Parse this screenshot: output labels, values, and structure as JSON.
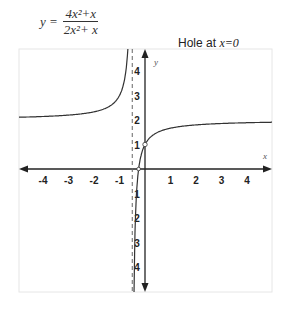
{
  "header": {
    "equation_lhs": "y =",
    "numerator": "4x²+x",
    "denominator": "2x²+ x",
    "hole_label": "Hole at",
    "hole_value": "x=0"
  },
  "chart_data": {
    "type": "line",
    "annotation": "Hole at x=0",
    "xlabel": "x",
    "ylabel": "y",
    "xlim": [
      -5,
      5
    ],
    "ylim": [
      -5,
      5
    ],
    "x_ticks": [
      "-4",
      "-3",
      "-2",
      "-1",
      "1",
      "2",
      "3",
      "4"
    ],
    "y_ticks_positive": [
      "1",
      "2",
      "3",
      "4"
    ],
    "y_ticks_negative": [
      "1",
      "2",
      "3",
      "4"
    ],
    "vertical_asymptote": -0.5,
    "horizontal_asymptote": 2,
    "hole": [
      0,
      1
    ],
    "series": [
      {
        "name": "left branch",
        "x": [
          -5,
          -4,
          -3,
          -2,
          -1.5,
          -1,
          -0.8,
          -0.7,
          -0.6
        ],
        "y": [
          2.11,
          2.14,
          2.2,
          2.33,
          2.5,
          3,
          3.67,
          4.5,
          7
        ]
      },
      {
        "name": "right branch",
        "x": [
          -0.45,
          -0.4,
          -0.3,
          -0.25,
          0,
          0.5,
          1,
          2,
          3,
          4,
          5
        ],
        "y": [
          -8,
          -3,
          -0.5,
          0,
          1,
          1.5,
          1.67,
          1.8,
          1.86,
          1.89,
          1.91
        ]
      }
    ],
    "grid": false,
    "legend": "none"
  }
}
